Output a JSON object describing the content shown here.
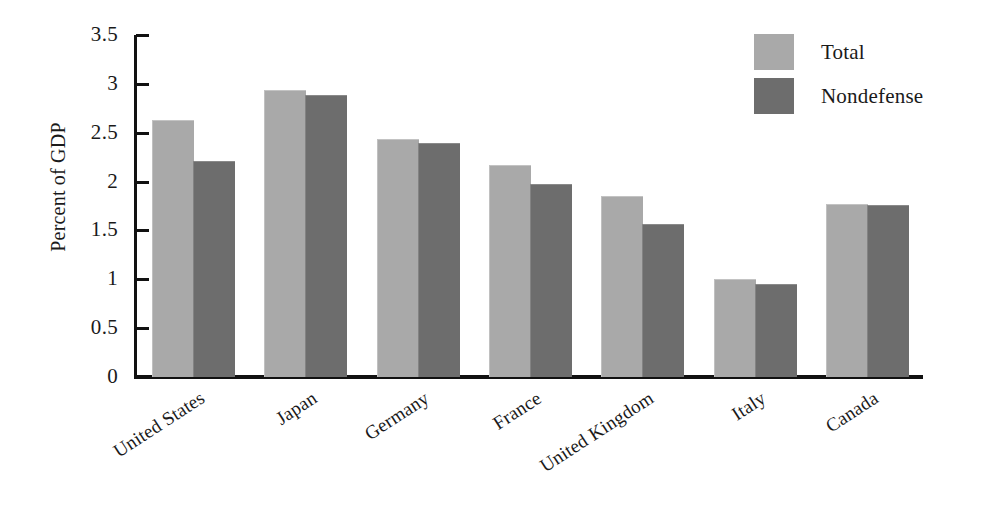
{
  "chart_data": {
    "type": "bar",
    "title": "",
    "subtitle": "",
    "xlabel": "",
    "ylabel": "Percent of GDP",
    "ylim": [
      0,
      3.5
    ],
    "ytick_values": [
      0,
      0.5,
      1,
      1.5,
      2,
      2.5,
      3,
      3.5
    ],
    "ytick_labels": [
      "0",
      "0.5",
      "1",
      "1.5",
      "2",
      "2.5",
      "3",
      "3.5"
    ],
    "grid": false,
    "legend_position": "top-right",
    "categories": [
      "United States",
      "Japan",
      "Germany",
      "France",
      "United Kingdom",
      "Italy",
      "Canada"
    ],
    "series": [
      {
        "name": "Total",
        "color": "#a9a9a9",
        "values": [
          2.62,
          2.93,
          2.43,
          2.16,
          1.84,
          0.99,
          1.76
        ]
      },
      {
        "name": "Nondefense",
        "color": "#6d6d6d",
        "values": [
          2.2,
          2.88,
          2.38,
          1.96,
          1.56,
          0.94,
          1.75
        ]
      }
    ]
  },
  "legend": {
    "items": [
      {
        "label": "Total",
        "swatch_class": "total"
      },
      {
        "label": "Nondefense",
        "swatch_class": "nondefense"
      }
    ]
  },
  "axis": {
    "y_title": "Percent of GDP"
  }
}
